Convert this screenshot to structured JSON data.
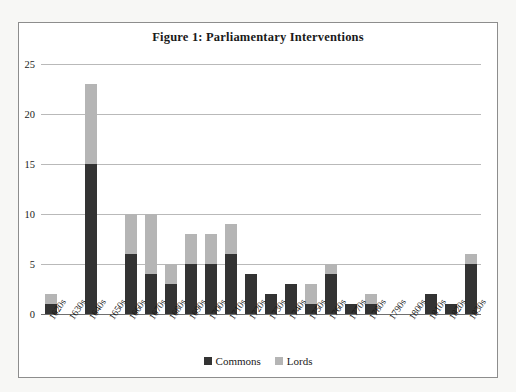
{
  "figure": {
    "title": "Figure 1: Parliamentary Interventions"
  },
  "legend": {
    "position": "bottom-center",
    "items": [
      {
        "label": "Commons",
        "color": "#333333",
        "swatch_name": "commons-swatch"
      },
      {
        "label": "Lords",
        "color": "#b5b5b5",
        "swatch_name": "lords-swatch"
      }
    ]
  },
  "axes": {
    "y_ticks": [
      "0",
      "5",
      "10",
      "15",
      "20",
      "25"
    ],
    "x_labels": [
      "1620s",
      "1630s",
      "1640s",
      "1650s",
      "1660s",
      "1670s",
      "1680s",
      "1690s",
      "1700s",
      "1710s",
      "1720s",
      "1730s",
      "1740s",
      "1750s",
      "1760s",
      "1770s",
      "1780s",
      "1790s",
      "1800s",
      "1810s",
      "1820s",
      "1830s"
    ]
  },
  "chart_data": {
    "type": "bar",
    "stacked": true,
    "title": "Figure 1: Parliamentary Interventions",
    "xlabel": "",
    "ylabel": "",
    "ylim": [
      0,
      25
    ],
    "yticks": [
      0,
      5,
      10,
      15,
      20,
      25
    ],
    "grid": true,
    "legend_position": "bottom-center",
    "categories": [
      "1620s",
      "1630s",
      "1640s",
      "1650s",
      "1660s",
      "1670s",
      "1680s",
      "1690s",
      "1700s",
      "1710s",
      "1720s",
      "1730s",
      "1740s",
      "1750s",
      "1760s",
      "1770s",
      "1780s",
      "1790s",
      "1800s",
      "1810s",
      "1820s",
      "1830s"
    ],
    "series": [
      {
        "name": "Commons",
        "color": "#333333",
        "values": [
          1,
          0,
          15,
          0,
          6,
          4,
          3,
          5,
          5,
          6,
          4,
          2,
          3,
          1,
          4,
          1,
          1,
          0,
          0,
          2,
          1,
          5
        ]
      },
      {
        "name": "Lords",
        "color": "#b5b5b5",
        "values": [
          1,
          0,
          8,
          0,
          4,
          6,
          2,
          3,
          3,
          3,
          0,
          0,
          0,
          2,
          1,
          0,
          1,
          0,
          0,
          0,
          0,
          1
        ]
      }
    ],
    "totals": [
      2,
      0,
      23,
      0,
      10,
      10,
      5,
      8,
      8,
      9,
      4,
      2,
      3,
      3,
      5,
      1,
      2,
      0,
      0,
      2,
      1,
      6
    ]
  }
}
